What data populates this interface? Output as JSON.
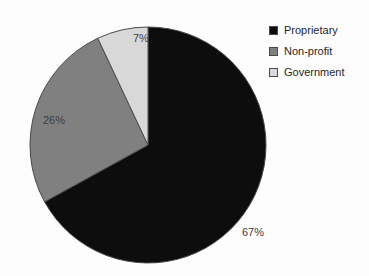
{
  "chart_data": {
    "type": "pie",
    "title": "",
    "subtitle": "",
    "xlabel": "",
    "ylabel": "",
    "grid": false,
    "legend_position": "top-right",
    "start_angle_deg": 0,
    "direction": "clockwise",
    "categories": [
      "Proprietary",
      "Non-profit",
      "Government"
    ],
    "values": [
      67,
      26,
      7
    ],
    "value_unit": "%",
    "data_labels": [
      "67%",
      "26%",
      "7%"
    ],
    "colors": [
      "#0d0d0d",
      "#808080",
      "#d8d8d8"
    ],
    "slice_border_color": "#4a4a4a",
    "annotations": []
  },
  "legend": {
    "items": [
      {
        "label": "Proprietary",
        "color": "#0d0d0d"
      },
      {
        "label": "Non-profit",
        "color": "#808080"
      },
      {
        "label": "Government",
        "color": "#d8d8d8"
      }
    ]
  },
  "ghost_text": {
    "top": "",
    "bottom": ""
  }
}
